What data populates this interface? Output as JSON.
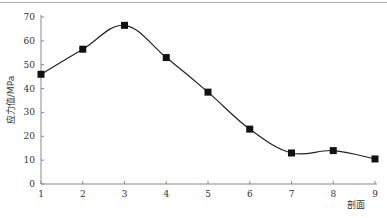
{
  "chart_data": {
    "type": "line",
    "title": "",
    "xlabel": "剖面",
    "ylabel": "应力值/MPa",
    "categories": [
      "1",
      "2",
      "3",
      "4",
      "5",
      "6",
      "7",
      "8",
      "9"
    ],
    "x": [
      1,
      2,
      3,
      4,
      5,
      6,
      7,
      8,
      9
    ],
    "series": [
      {
        "name": "应力值",
        "values": [
          46,
          56.5,
          66.5,
          53,
          38.5,
          23,
          13,
          14,
          10.5
        ],
        "marker": "square",
        "smooth": true,
        "color": "#222222"
      }
    ],
    "yticks": [
      0,
      10,
      20,
      30,
      40,
      50,
      60,
      70
    ],
    "ylim": [
      0,
      70
    ],
    "xlim": [
      1,
      9
    ],
    "grid": false,
    "legend": "none"
  }
}
